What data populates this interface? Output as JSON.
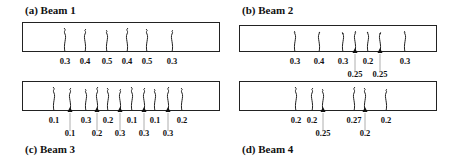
{
  "panels": [
    {
      "id": "a",
      "title": "(a) Beam 1",
      "box": {
        "x": 22,
        "y": 22,
        "w": 198,
        "h": 30
      },
      "title_pos": {
        "x": 25,
        "y": 4
      },
      "cracks": [
        {
          "x": 65,
          "width_mm": "0.3",
          "row": 0
        },
        {
          "x": 85,
          "width_mm": "0.4",
          "row": 0
        },
        {
          "x": 107,
          "width_mm": "0.5",
          "row": 0
        },
        {
          "x": 127,
          "width_mm": "0.4",
          "row": 0
        },
        {
          "x": 147,
          "width_mm": "0.5",
          "row": 0
        },
        {
          "x": 172,
          "width_mm": "0.3",
          "row": 0
        }
      ]
    },
    {
      "id": "b",
      "title": "(b) Beam 2",
      "box": {
        "x": 239,
        "y": 25,
        "w": 198,
        "h": 27
      },
      "title_pos": {
        "x": 242,
        "y": 4
      },
      "cracks": [
        {
          "x": 295,
          "width_mm": "0.3",
          "row": 0
        },
        {
          "x": 319,
          "width_mm": "0.4",
          "row": 0
        },
        {
          "x": 343,
          "width_mm": "0.3",
          "row": 0
        },
        {
          "x": 355,
          "width_mm": "0.25",
          "row": 1
        },
        {
          "x": 368,
          "width_mm": "0.2",
          "row": 0
        },
        {
          "x": 380,
          "width_mm": "0.25",
          "row": 1
        },
        {
          "x": 405,
          "width_mm": "0.3",
          "row": 0
        }
      ]
    },
    {
      "id": "c",
      "title": "(c) Beam 3",
      "box": {
        "x": 22,
        "y": 81,
        "w": 198,
        "h": 30
      },
      "title_pos": {
        "x": 25,
        "y": 143
      },
      "cracks": [
        {
          "x": 54,
          "width_mm": "0.1",
          "row": 0
        },
        {
          "x": 70,
          "width_mm": "0.1",
          "row": 1
        },
        {
          "x": 86,
          "width_mm": "0.3",
          "row": 0
        },
        {
          "x": 97,
          "width_mm": "0.2",
          "row": 1
        },
        {
          "x": 108,
          "width_mm": "0.2",
          "row": 0
        },
        {
          "x": 120,
          "width_mm": "0.3",
          "row": 1
        },
        {
          "x": 132,
          "width_mm": "0.1",
          "row": 0
        },
        {
          "x": 144,
          "width_mm": "0.3",
          "row": 1
        },
        {
          "x": 155,
          "width_mm": "0.1",
          "row": 0
        },
        {
          "x": 168,
          "width_mm": "0.3",
          "row": 1
        },
        {
          "x": 182,
          "width_mm": "0.2",
          "row": 0
        }
      ]
    },
    {
      "id": "d",
      "title": "(d) Beam 4",
      "box": {
        "x": 239,
        "y": 81,
        "w": 198,
        "h": 30
      },
      "title_pos": {
        "x": 242,
        "y": 143
      },
      "cracks": [
        {
          "x": 296,
          "width_mm": "0.2",
          "row": 0
        },
        {
          "x": 312,
          "width_mm": "0.2",
          "row": 0
        },
        {
          "x": 323,
          "width_mm": "0.25",
          "row": 1
        },
        {
          "x": 354,
          "width_mm": "0.27",
          "row": 0
        },
        {
          "x": 365,
          "width_mm": "0.2",
          "row": 1
        },
        {
          "x": 386,
          "width_mm": "0.2",
          "row": 0
        }
      ]
    }
  ],
  "colors": {
    "line": "#222222",
    "text": "#111111",
    "pointer": "#9a9a9a"
  }
}
